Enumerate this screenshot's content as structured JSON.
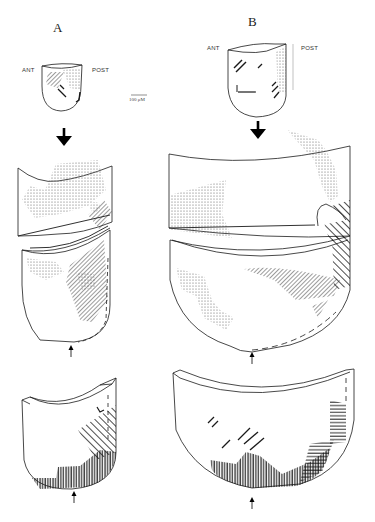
{
  "figure": {
    "panels": [
      {
        "id": "A",
        "label": "A",
        "orientation": {
          "left": "ANT",
          "right": "POST"
        },
        "views": [
          "whole-specimen",
          "opened-sections",
          "lower-section"
        ]
      },
      {
        "id": "B",
        "label": "B",
        "orientation": {
          "left": "ANT",
          "right": "POST"
        },
        "views": [
          "whole-specimen",
          "opened-sections",
          "lower-section"
        ]
      }
    ],
    "scale_bar": {
      "label": "100 μM"
    },
    "legend_patterns": [
      "stippled",
      "diagonal-hatching",
      "vertical-hatching",
      "horizontal-hatching",
      "dashed-outline"
    ],
    "colors": {
      "ink": "#1a1a1a",
      "stipple": "#555555",
      "background": "#ffffff"
    }
  }
}
